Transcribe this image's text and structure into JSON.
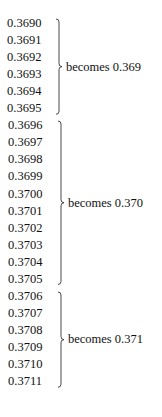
{
  "groups": [
    {
      "values": [
        "0.3690",
        "0.3691",
        "0.3692",
        "0.3693",
        "0.3694",
        "0.3695"
      ],
      "label": "becomes 0.369"
    },
    {
      "values": [
        "0.3696",
        "0.3697",
        "0.3698",
        "0.3699",
        "0.3700",
        "0.3701",
        "0.3702",
        "0.3703",
        "0.3704",
        "0.3705"
      ],
      "label": "becomes 0.370"
    },
    {
      "values": [
        "0.3706",
        "0.3707",
        "0.3708",
        "0.3709",
        "0.3710",
        "0.3711"
      ],
      "label": "becomes 0.371"
    }
  ]
}
